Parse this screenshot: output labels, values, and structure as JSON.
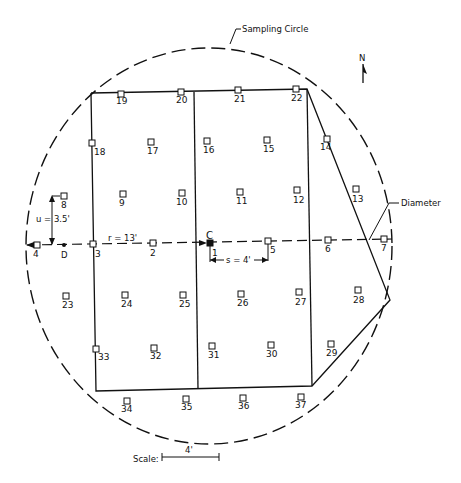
{
  "title_labels": {
    "sampling_circle": "Sampling Circle",
    "diameter": "Diameter",
    "north": "N",
    "center": "C",
    "point_d": "D",
    "u_label": "u = 3.5'",
    "r_label": "r = 13'",
    "s_label": "s = 4'",
    "scale_label": "Scale:",
    "scale_value": "4'"
  },
  "colors": {
    "ink": "#111111",
    "background": "#ffffff"
  },
  "points": [
    {
      "id": "1",
      "x": 210,
      "y": 243,
      "lx": 212,
      "ly": 256,
      "filled": true
    },
    {
      "id": "2",
      "x": 153,
      "y": 243,
      "lx": 150,
      "ly": 256
    },
    {
      "id": "3",
      "x": 93,
      "y": 244,
      "lx": 95,
      "ly": 257
    },
    {
      "id": "4",
      "x": 37,
      "y": 245,
      "lx": 33,
      "ly": 257
    },
    {
      "id": "5",
      "x": 268,
      "y": 241,
      "lx": 270,
      "ly": 253
    },
    {
      "id": "6",
      "x": 328,
      "y": 240,
      "lx": 325,
      "ly": 252
    },
    {
      "id": "7",
      "x": 384,
      "y": 239,
      "lx": 381,
      "ly": 251
    },
    {
      "id": "8",
      "x": 64,
      "y": 196,
      "lx": 61,
      "ly": 208
    },
    {
      "id": "9",
      "x": 123,
      "y": 194,
      "lx": 119,
      "ly": 206
    },
    {
      "id": "10",
      "x": 182,
      "y": 193,
      "lx": 176,
      "ly": 205
    },
    {
      "id": "11",
      "x": 240,
      "y": 192,
      "lx": 236,
      "ly": 204
    },
    {
      "id": "12",
      "x": 297,
      "y": 190,
      "lx": 293,
      "ly": 203
    },
    {
      "id": "13",
      "x": 356,
      "y": 189,
      "lx": 352,
      "ly": 202
    },
    {
      "id": "14",
      "x": 327,
      "y": 139,
      "lx": 320,
      "ly": 150
    },
    {
      "id": "15",
      "x": 267,
      "y": 140,
      "lx": 263,
      "ly": 152
    },
    {
      "id": "16",
      "x": 207,
      "y": 141,
      "lx": 203,
      "ly": 153
    },
    {
      "id": "17",
      "x": 151,
      "y": 142,
      "lx": 147,
      "ly": 154
    },
    {
      "id": "18",
      "x": 92,
      "y": 143,
      "lx": 94,
      "ly": 155
    },
    {
      "id": "19",
      "x": 121,
      "y": 94,
      "lx": 116,
      "ly": 104
    },
    {
      "id": "20",
      "x": 181,
      "y": 92,
      "lx": 176,
      "ly": 103
    },
    {
      "id": "21",
      "x": 238,
      "y": 90,
      "lx": 234,
      "ly": 102
    },
    {
      "id": "22",
      "x": 296,
      "y": 89,
      "lx": 291,
      "ly": 101
    },
    {
      "id": "23",
      "x": 66,
      "y": 296,
      "lx": 62,
      "ly": 308
    },
    {
      "id": "24",
      "x": 125,
      "y": 295,
      "lx": 121,
      "ly": 307
    },
    {
      "id": "25",
      "x": 183,
      "y": 295,
      "lx": 179,
      "ly": 307
    },
    {
      "id": "26",
      "x": 241,
      "y": 294,
      "lx": 237,
      "ly": 306
    },
    {
      "id": "27",
      "x": 299,
      "y": 292,
      "lx": 295,
      "ly": 305
    },
    {
      "id": "28",
      "x": 358,
      "y": 290,
      "lx": 353,
      "ly": 303
    },
    {
      "id": "29",
      "x": 331,
      "y": 344,
      "lx": 326,
      "ly": 356
    },
    {
      "id": "30",
      "x": 271,
      "y": 345,
      "lx": 266,
      "ly": 357
    },
    {
      "id": "31",
      "x": 212,
      "y": 346,
      "lx": 208,
      "ly": 358
    },
    {
      "id": "32",
      "x": 154,
      "y": 348,
      "lx": 150,
      "ly": 359
    },
    {
      "id": "33",
      "x": 96,
      "y": 349,
      "lx": 98,
      "ly": 360
    },
    {
      "id": "34",
      "x": 127,
      "y": 401,
      "lx": 121,
      "ly": 412
    },
    {
      "id": "35",
      "x": 186,
      "y": 399,
      "lx": 181,
      "ly": 410
    },
    {
      "id": "36",
      "x": 243,
      "y": 398,
      "lx": 238,
      "ly": 409
    },
    {
      "id": "37",
      "x": 301,
      "y": 397,
      "lx": 295,
      "ly": 408
    }
  ]
}
